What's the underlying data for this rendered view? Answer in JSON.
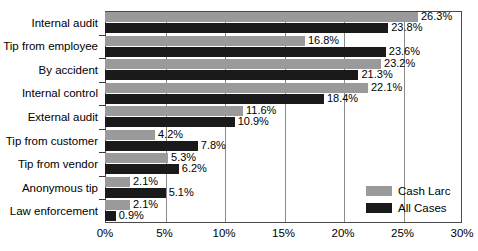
{
  "chart_data": {
    "type": "bar",
    "orientation": "horizontal",
    "title": "",
    "subtitle": "",
    "xlabel": "",
    "ylabel": "",
    "xlim": [
      0,
      30
    ],
    "xticks": [
      "0%",
      "5%",
      "10%",
      "15%",
      "20%",
      "25%",
      "30%"
    ],
    "xtick_values": [
      0,
      5,
      10,
      15,
      20,
      25,
      30
    ],
    "grid": true,
    "legend_position": "bottom-right",
    "categories": [
      "Internal audit",
      "Tip from employee",
      "By accident",
      "Internal control",
      "External audit",
      "Tip from customer",
      "Tip from vendor",
      "Anonymous tip",
      "Law enforcement"
    ],
    "series": [
      {
        "name": "Cash Larc",
        "color": "#9a9a9a",
        "values": [
          26.3,
          16.8,
          23.2,
          22.1,
          11.6,
          4.2,
          5.3,
          2.1,
          2.1
        ],
        "labels": [
          "26.3%",
          "16.8%",
          "23.2%",
          "22.1%",
          "11.6%",
          "4.2%",
          "5.3%",
          "2.1%",
          "2.1%"
        ]
      },
      {
        "name": "All Cases",
        "color": "#1a1a1a",
        "values": [
          23.8,
          23.6,
          21.3,
          18.4,
          10.9,
          7.8,
          6.2,
          5.1,
          0.9
        ],
        "labels": [
          "23.8%",
          "23.6%",
          "21.3%",
          "18.4%",
          "10.9%",
          "7.8%",
          "6.2%",
          "5.1%",
          "0.9%"
        ]
      }
    ]
  }
}
